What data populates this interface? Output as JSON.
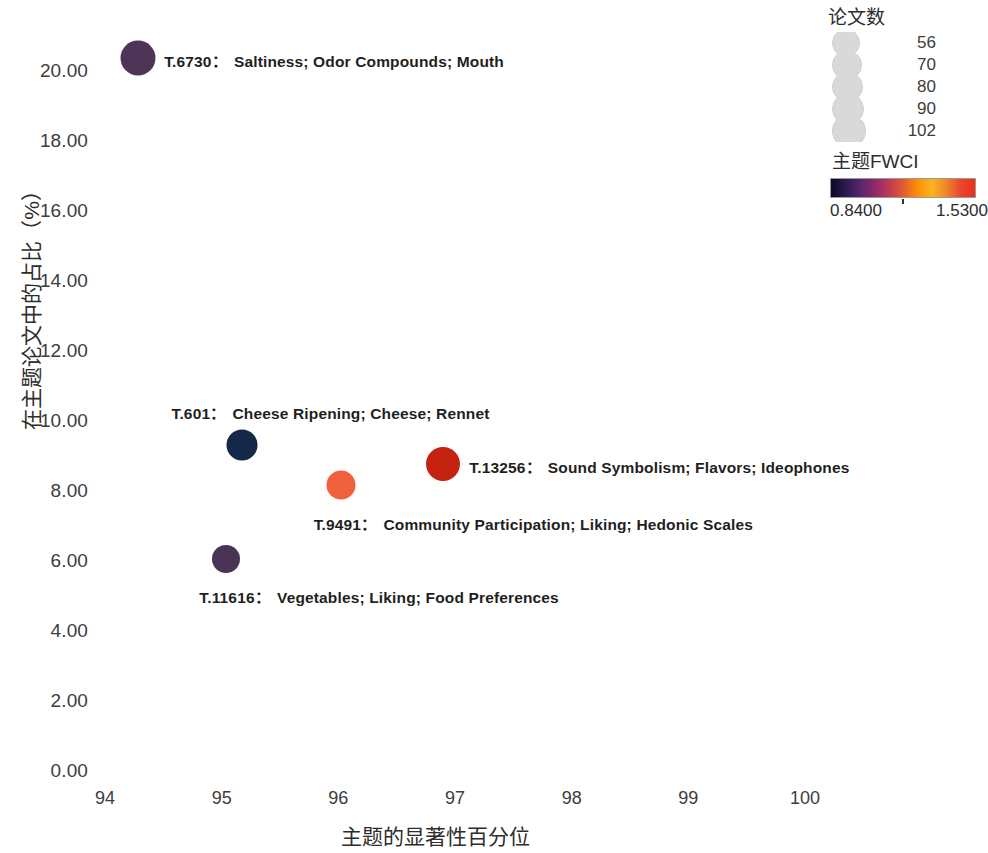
{
  "chart_data": {
    "type": "scatter",
    "title": "",
    "xlabel": "主题的显著性百分位",
    "ylabel": "在主题论文中的占比（%）",
    "xlim": [
      93.5,
      100.6
    ],
    "ylim": [
      -0.3,
      21.0
    ],
    "xticks": [
      "94",
      "95",
      "96",
      "97",
      "98",
      "99",
      "100"
    ],
    "xtick_values": [
      94,
      95,
      96,
      97,
      98,
      99,
      100
    ],
    "yticks": [
      "0.00",
      "2.00",
      "4.00",
      "6.00",
      "8.00",
      "10.00",
      "12.00",
      "14.00",
      "16.00",
      "18.00",
      "20.00"
    ],
    "ytick_values": [
      0,
      2,
      4,
      6,
      8,
      10,
      12,
      14,
      16,
      18,
      20
    ],
    "grid": false,
    "legend_position": "top-right",
    "points": [
      {
        "id": "T.6730",
        "label": "T.6730：Saltiness; Odor Compounds; Mouth",
        "topic_id": "T.6730",
        "separator": "：",
        "terms": "Saltiness; Odor Compounds; Mouth",
        "x": 94.28,
        "y": 20.37,
        "papers": 102,
        "fwci": 1.02,
        "color": "#4c3557",
        "radius_px": 17.5,
        "label_side": "right"
      },
      {
        "id": "T.601",
        "label": "T.601：Cheese Ripening; Cheese; Rennet",
        "topic_id": "T.601",
        "separator": "：",
        "terms": "Cheese Ripening; Cheese; Rennet",
        "x": 95.17,
        "y": 9.31,
        "papers": 80,
        "fwci": 0.84,
        "color": "#15284a",
        "radius_px": 15.5,
        "label_side": "above"
      },
      {
        "id": "T.9491",
        "label": "T.9491：Community Participation; Liking; Hedonic Scales",
        "topic_id": "T.9491",
        "separator": "：",
        "terms": "Community Participation; Liking; Hedonic Scales",
        "x": 96.02,
        "y": 8.17,
        "papers": 70,
        "fwci": 1.33,
        "color": "#f1603c",
        "radius_px": 14.5,
        "label_side": "below"
      },
      {
        "id": "T.13256",
        "label": "T.13256：Sound Symbolism; Flavors; Ideophones",
        "topic_id": "T.13256",
        "separator": "：",
        "terms": "Sound Symbolism; Flavors; Ideophones",
        "x": 96.9,
        "y": 8.77,
        "papers": 90,
        "fwci": 1.53,
        "color": "#c52310",
        "radius_px": 17,
        "label_side": "right"
      },
      {
        "id": "T.11616",
        "label": "T.11616：Vegetables; Liking; Food Preferences",
        "topic_id": "T.11616",
        "separator": "：",
        "terms": "Vegetables; Liking; Food Preferences",
        "x": 95.04,
        "y": 6.06,
        "papers": 56,
        "fwci": 0.95,
        "color": "#4a3355",
        "radius_px": 14,
        "label_side": "below"
      }
    ],
    "size_legend": {
      "title": "论文数",
      "values": [
        "56",
        "70",
        "80",
        "90",
        "102"
      ],
      "numeric_values": [
        56,
        70,
        80,
        90,
        102
      ]
    },
    "color_legend": {
      "title": "主题FWCI",
      "min": "0.8400",
      "max": "1.5300",
      "min_value": 0.84,
      "max_value": 1.53,
      "colormap": "magma",
      "stops": [
        "#0d0827",
        "#2a1a4f",
        "#54276d",
        "#8b2a6a",
        "#bc3754",
        "#e45a31",
        "#f98e09",
        "#fbb41f",
        "#f0842c",
        "#e8472c",
        "#e8301d"
      ]
    }
  }
}
